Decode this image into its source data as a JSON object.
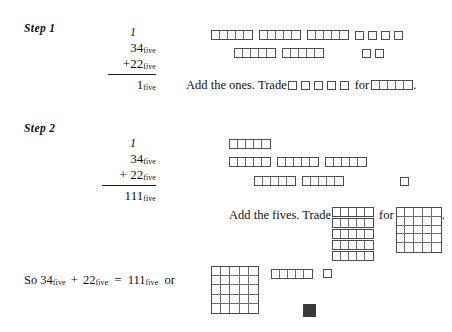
{
  "page": {
    "topic": "base-five addition with block models",
    "background": "#ffffff",
    "block_border_color": "#4d4d4d",
    "block_fill_color": "#ffffff",
    "filled_block_color": "#3a3a3a"
  },
  "step1": {
    "label": "Step 1",
    "problem": {
      "carry": "1",
      "addend1": "34",
      "addend1_sub": "five",
      "operator": "+",
      "addend2": "22",
      "addend2_sub": "five",
      "result": "1",
      "result_sub": "five"
    },
    "instruction_prefix": "Add the ones.  Trade",
    "instruction_middle": "for",
    "instruction_suffix": ".",
    "trade_from_units": 5,
    "trade_to_strip_cells": 5,
    "model_row1": {
      "strips": 3,
      "strip_cells": 5,
      "loose_units": 4
    },
    "model_row2": {
      "strips": 2,
      "strip_cells": 5,
      "loose_units": 2
    }
  },
  "step2": {
    "label": "Step 2",
    "problem": {
      "carry": "1",
      "addend1": "34",
      "addend1_sub": "five",
      "operator": "+",
      "addend2": "22",
      "addend2_sub": "five",
      "result": "111",
      "result_sub": "five"
    },
    "instruction_prefix": "Add the fives.  Trade",
    "instruction_middle": "for",
    "instruction_suffix": ".",
    "model_row1_strips": 1,
    "model_row2_strips": 3,
    "model_row3_strips": 2,
    "model_row3_loose_units": 1,
    "trade_from_strips": 5,
    "trade_strip_cells": 5,
    "trade_to_flat_rows": 5,
    "trade_to_flat_cols": 5
  },
  "conclusion": {
    "text_parts": {
      "so": "So",
      "addend1": "34",
      "addend1_sub": "five",
      "plus": "+",
      "addend2": "22",
      "addend2_sub": "five",
      "equals": "=",
      "result": "111",
      "result_sub": "five",
      "or": "or"
    },
    "model": {
      "flat_rows": 5,
      "flat_cols": 5,
      "strip_cells": 5,
      "loose_units": 1,
      "filled_units": 1
    }
  }
}
